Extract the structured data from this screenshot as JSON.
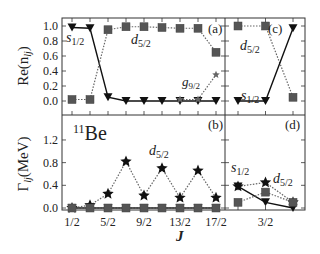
{
  "chart_data": [
    {
      "panel": "(a)",
      "type": "line",
      "ylabel": "Re(n_lj)",
      "ylim": [
        0.0,
        1.0
      ],
      "yticks": [
        "0.0",
        "0.2",
        "0.4",
        "0.6",
        "0.8",
        "1.0"
      ],
      "x": [
        "1/2",
        "3/2",
        "5/2",
        "7/2",
        "9/2",
        "11/2",
        "13/2",
        "15/2",
        "17/2"
      ],
      "series": [
        {
          "name": "s1/2",
          "marker": "triangle-down",
          "line": "solid",
          "values": [
            0.98,
            0.97,
            0.05,
            0.0,
            0.0,
            0.0,
            0.0,
            0.0,
            0.0
          ]
        },
        {
          "name": "d5/2",
          "marker": "square",
          "line": "dotted",
          "values": [
            0.02,
            0.02,
            0.95,
            0.99,
            0.99,
            0.98,
            0.97,
            0.97,
            0.65
          ]
        },
        {
          "name": "g9/2",
          "marker": "star",
          "line": "dotted",
          "values": [
            null,
            null,
            null,
            null,
            null,
            null,
            0.02,
            0.02,
            0.35
          ]
        }
      ]
    },
    {
      "panel": "(b)",
      "type": "line",
      "ylabel": "Γ_lj(MeV)",
      "xlabel": "J",
      "annotation": "11Be",
      "ylim": [
        0.0,
        1.45
      ],
      "yticks": [
        "0.0",
        "0.4",
        "0.8",
        "1.2"
      ],
      "x": [
        "1/2",
        "3/2",
        "5/2",
        "7/2",
        "9/2",
        "11/2",
        "13/2",
        "15/2",
        "17/2"
      ],
      "xticklabels": [
        "1/2",
        "5/2",
        "9/2",
        "13/2",
        "17/2"
      ],
      "series": [
        {
          "name": "d5/2",
          "marker": "star",
          "line": "dotted",
          "values": [
            0.0,
            0.05,
            0.25,
            0.82,
            0.22,
            0.7,
            0.18,
            0.66,
            0.18
          ]
        },
        {
          "name": "s1/2",
          "marker": "triangle-down",
          "line": "solid",
          "values": [
            0.0,
            0.0,
            0.0,
            0.0,
            0.0,
            0.0,
            0.0,
            0.0,
            0.0
          ]
        },
        {
          "name": "square",
          "marker": "square",
          "line": "dotted",
          "values": [
            0.0,
            0.0,
            0.0,
            0.0,
            0.0,
            0.0,
            0.0,
            0.0,
            0.0
          ]
        }
      ]
    },
    {
      "panel": "(c)",
      "type": "line",
      "ylim": [
        0.0,
        1.0
      ],
      "x": [
        "1/2",
        "3/2",
        "5/2"
      ],
      "series": [
        {
          "name": "d5/2",
          "marker": "square",
          "line": "dotted",
          "values": [
            1.0,
            1.0,
            0.05
          ]
        },
        {
          "name": "s1/2",
          "marker": "triangle-down",
          "line": "solid",
          "values": [
            0.0,
            0.0,
            0.97
          ]
        }
      ]
    },
    {
      "panel": "(d)",
      "type": "line",
      "ylim": [
        0.0,
        1.45
      ],
      "x": [
        "1/2",
        "3/2",
        "5/2"
      ],
      "xticklabels": [
        "3/2"
      ],
      "series": [
        {
          "name": "s1/2",
          "marker": "triangle-down",
          "line": "solid",
          "values": [
            0.38,
            0.1,
            0.0
          ]
        },
        {
          "name": "d5/2",
          "marker": "star",
          "line": "dotted",
          "values": [
            0.38,
            0.45,
            0.1
          ]
        },
        {
          "name": "square",
          "marker": "square",
          "line": "dotted",
          "values": [
            0.1,
            0.28,
            0.1
          ]
        }
      ]
    }
  ],
  "labels": {
    "panel_a": "(a)",
    "panel_b": "(b)",
    "panel_c": "(c)",
    "panel_d": "(d)",
    "s12": "s",
    "s12_sub": "1/2",
    "d52": "d",
    "d52_sub": "5/2",
    "g92": "g",
    "g92_sub": "9/2",
    "nucleus_mass": "11",
    "nucleus": "Be",
    "ylabel_top": "Re(n",
    "ylabel_top_sub": "lj",
    "ylabel_top_close": ")",
    "ylabel_bottom": "Γ",
    "ylabel_bottom_sub": "lj",
    "ylabel_bottom_rest": "(MeV)",
    "xlabel": "J"
  }
}
